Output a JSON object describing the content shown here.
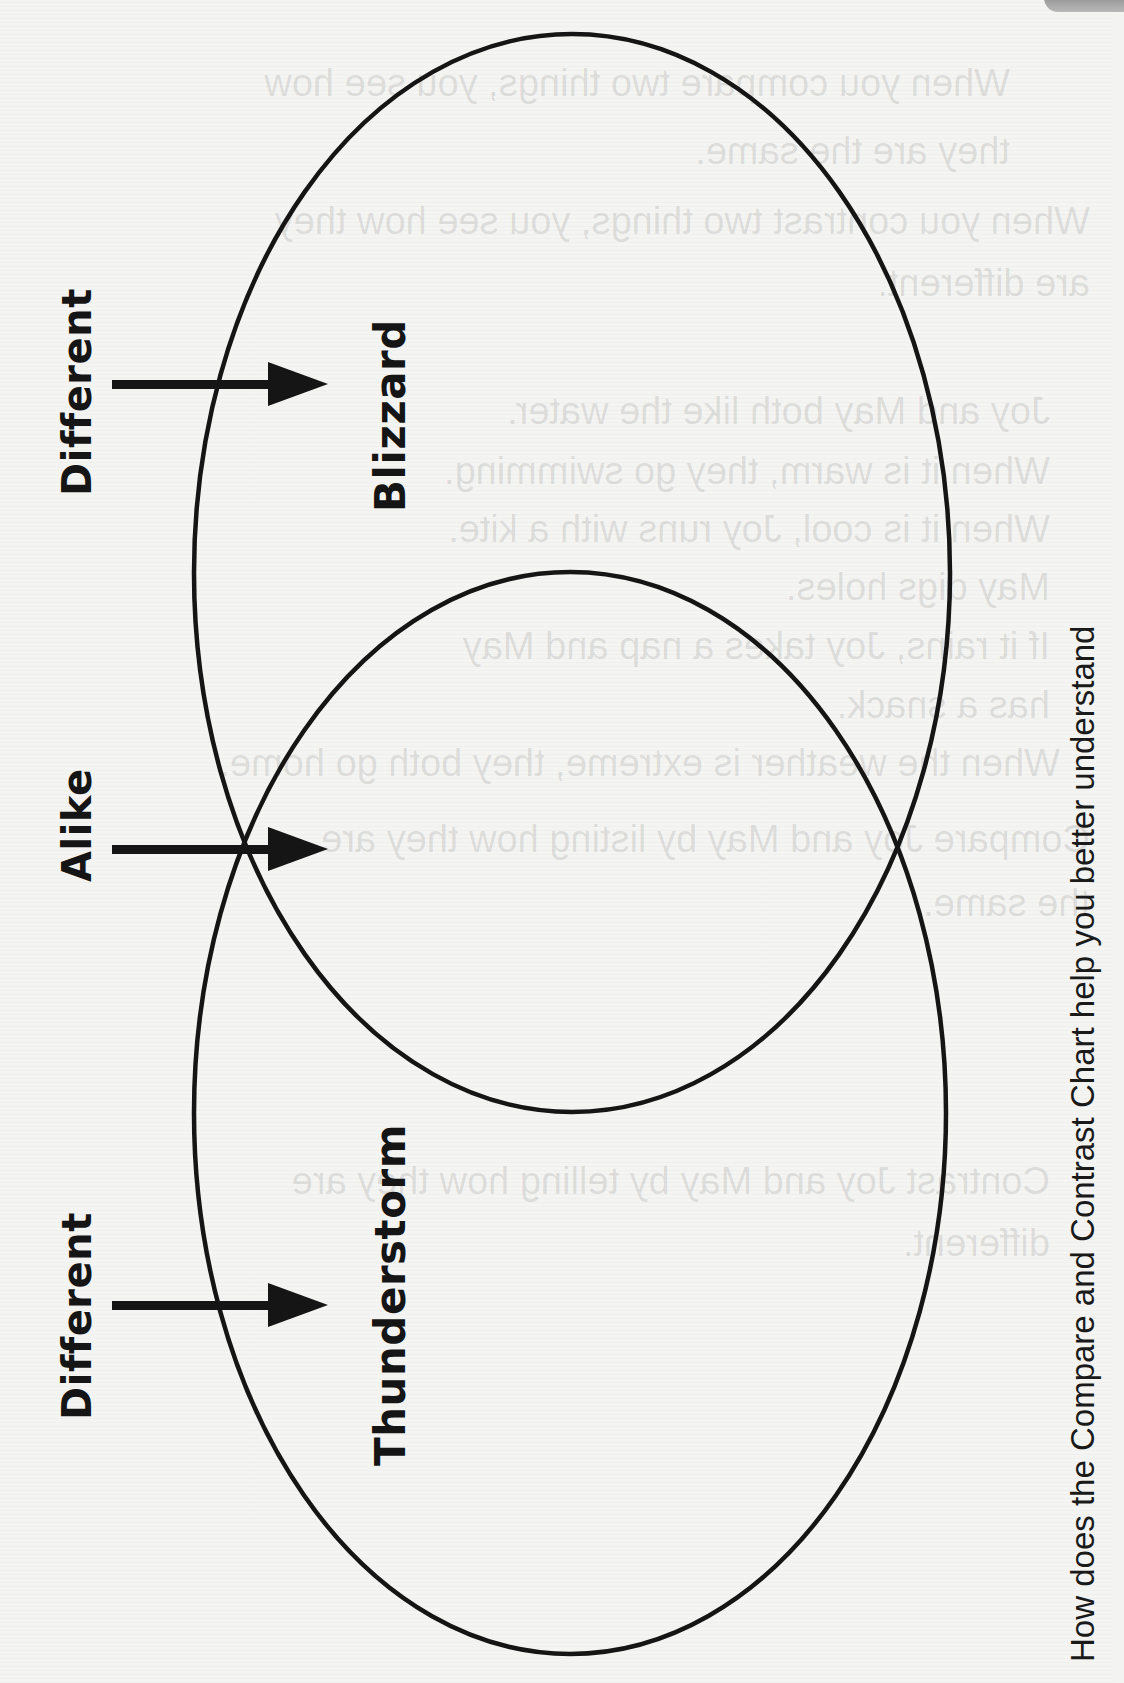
{
  "diagram": {
    "type": "venn",
    "orientation": "rotated-90-ccw",
    "circles": [
      {
        "id": "top",
        "label": "Blizzard"
      },
      {
        "id": "bottom",
        "label": "Thunderstorm"
      }
    ],
    "side_labels": [
      {
        "text": "Different",
        "target": "Blizzard"
      },
      {
        "text": "Alike",
        "target": "overlap"
      },
      {
        "text": "Different",
        "target": "Thunderstorm"
      }
    ],
    "question": "How does the Compare and Contrast Chart help you better understand",
    "colors": {
      "ink": "#151515",
      "paper": "#f3f3f2"
    }
  },
  "bleed_through_text": [
    "When you compare two things, you see how",
    "they are the same.",
    "When you contrast two things, you see how they",
    "are different.",
    "Joy and May both like the water.",
    "When it is warm, they go swimming.",
    "When it is cool, Joy runs with a kite.",
    "May digs holes.",
    "If it rains, Joy takes a nap and May",
    "has a snack.",
    "When the weather is extreme, they both go home.",
    "Compare Joy and May by listing how they are",
    "the same.",
    "Contrast Joy and May by telling how they are",
    "different."
  ]
}
